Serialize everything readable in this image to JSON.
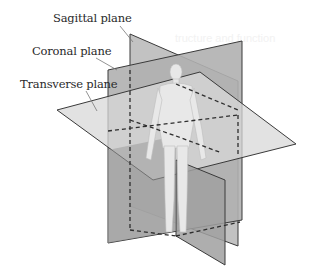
{
  "figure": {
    "labels": {
      "sagittal": "Sagittal plane",
      "coronal": "Coronal plane",
      "transverse": "Transverse plane"
    },
    "colors": {
      "background": "#ffffff",
      "plane_fill_dark": "#9a9a9a",
      "plane_fill_mid": "#b5b5b5",
      "plane_fill_light": "#d6d6d6",
      "plane_edge": "#3a3a3a",
      "dashed_line": "#2e2e2e",
      "leader_line": "#777777",
      "body": "#e6e6e6",
      "label_text": "#2a2a2a"
    },
    "ghost_text": [
      "tructure and function"
    ]
  }
}
